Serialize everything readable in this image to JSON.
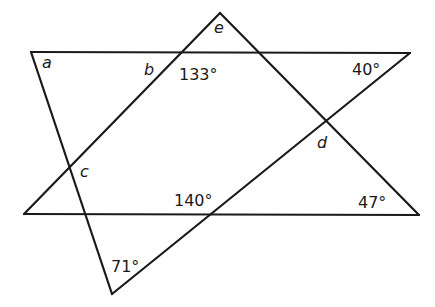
{
  "diagram": {
    "stroke_color": "#1a1a1a",
    "background": "#ffffff",
    "vertices": {
      "A": [
        31,
        52
      ],
      "E": [
        220,
        13
      ],
      "R": [
        410,
        53
      ],
      "L": [
        24,
        214
      ],
      "BR": [
        419,
        215
      ],
      "V": [
        112,
        294
      ]
    },
    "segments": [
      {
        "from": "A",
        "to": "R",
        "name": "top-line"
      },
      {
        "from": "L",
        "to": "BR",
        "name": "bottom-line"
      },
      {
        "from": "A",
        "to": "V",
        "name": "left-descending-line"
      },
      {
        "from": "V",
        "to": "R",
        "name": "rising-line-to-right"
      },
      {
        "from": "L",
        "to": "E",
        "name": "rising-line-to-apex"
      },
      {
        "from": "E",
        "to": "BR",
        "name": "descending-line-from-apex"
      }
    ],
    "unknown_labels": [
      {
        "id": "a",
        "text": "a",
        "x": 42,
        "y": 68
      },
      {
        "id": "b",
        "text": "b",
        "x": 144,
        "y": 75
      },
      {
        "id": "c",
        "text": "c",
        "x": 80,
        "y": 177
      },
      {
        "id": "d",
        "text": "d",
        "x": 317,
        "y": 148
      },
      {
        "id": "e",
        "text": "e",
        "x": 214,
        "y": 33
      }
    ],
    "angle_labels": [
      {
        "id": "angle-133",
        "text": "133°",
        "x": 179,
        "y": 80
      },
      {
        "id": "angle-40",
        "text": "40°",
        "x": 352,
        "y": 75
      },
      {
        "id": "angle-140",
        "text": "140°",
        "x": 174,
        "y": 206
      },
      {
        "id": "angle-47",
        "text": "47°",
        "x": 358,
        "y": 208
      },
      {
        "id": "angle-71",
        "text": "71°",
        "x": 111,
        "y": 272
      }
    ]
  }
}
